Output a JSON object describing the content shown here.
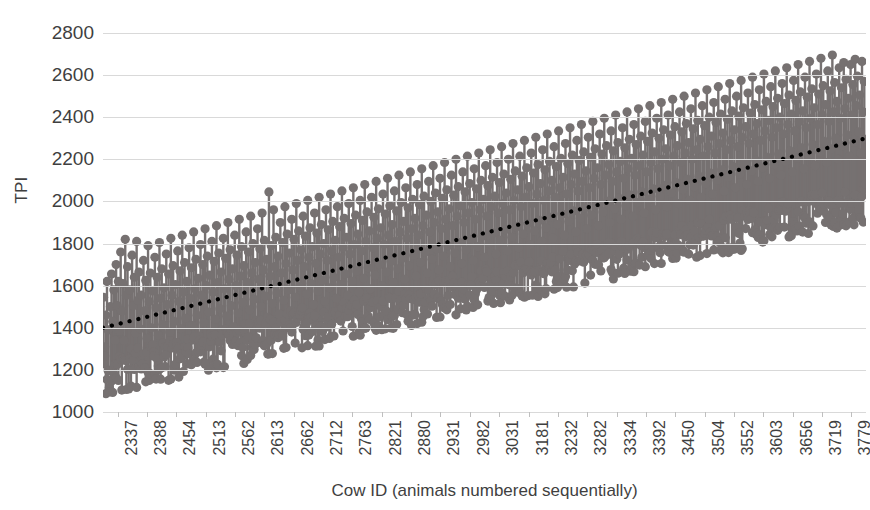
{
  "chart_data": {
    "type": "bar",
    "subtype": "stem-lollipop-with-trendline",
    "title": "",
    "xlabel": "Cow ID (animals numbered sequentially)",
    "ylabel": "TPI",
    "ylim": [
      1000,
      2800
    ],
    "ytick_step": 200,
    "yticks": [
      2800,
      2600,
      2400,
      2200,
      2000,
      1800,
      1600,
      1400,
      1200,
      1000
    ],
    "grid": true,
    "legend": "none",
    "marker_color": "#767171",
    "stem_color": "#767171",
    "trendline_color": "#000000",
    "trendline_style": "dotted",
    "gridline_color": "#d9d9d9",
    "xtick_labels": [
      "2337",
      "2388",
      "2454",
      "2513",
      "2562",
      "2613",
      "2662",
      "2712",
      "2763",
      "2821",
      "2880",
      "2931",
      "2982",
      "3031",
      "3181",
      "3232",
      "3282",
      "3334",
      "3392",
      "3450",
      "3504",
      "3552",
      "3603",
      "3656",
      "3719",
      "3779"
    ],
    "xlim_ids": [
      2337,
      3779
    ],
    "n_xticks": 26,
    "trendline": {
      "x_start_id": 2337,
      "x_end_id": 3779,
      "y_start": 1400,
      "y_end": 2300
    },
    "series": [
      {
        "name": "TPI",
        "note": "One stem per animal; baseline drops from marker; approximately 1450 animals plotted left-to-right by sequential Cow ID.",
        "values": [
          1545,
          1310,
          1460,
          1620,
          1390,
          1115,
          1500,
          1655,
          1430,
          1580,
          1340,
          1700,
          1505,
          1620,
          1385,
          1760,
          1480,
          1610,
          1340,
          1820,
          1555,
          1690,
          1420,
          1580,
          1300,
          1745,
          1505,
          1640,
          1375,
          1810,
          1530,
          1665,
          1395,
          1555,
          1250,
          1720,
          1480,
          1625,
          1350,
          1790,
          1525,
          1660,
          1400,
          1575,
          1285,
          1735,
          1495,
          1640,
          1365,
          1805,
          1540,
          1680,
          1415,
          1590,
          1310,
          1750,
          1510,
          1655,
          1380,
          1825,
          1555,
          1695,
          1430,
          1605,
          1330,
          1765,
          1525,
          1670,
          1395,
          1840,
          1570,
          1710,
          1445,
          1620,
          1345,
          1780,
          1540,
          1685,
          1410,
          1855,
          1585,
          1725,
          1460,
          1635,
          1360,
          1795,
          1555,
          1700,
          1425,
          1870,
          1600,
          1740,
          1475,
          1650,
          1375,
          1810,
          1570,
          1715,
          1440,
          1885,
          1615,
          1755,
          1490,
          1665,
          1390,
          1825,
          1585,
          1730,
          1455,
          1900,
          1630,
          1770,
          1505,
          1680,
          1405,
          1840,
          1600,
          1745,
          1470,
          1915,
          1645,
          1785,
          1520,
          1695,
          1420,
          1855,
          1615,
          1760,
          1485,
          1930,
          1660,
          1800,
          1535,
          1710,
          1435,
          1870,
          1630,
          1775,
          1500,
          1945,
          1675,
          1815,
          1550,
          1725,
          1450,
          2045,
          1645,
          1790,
          1515,
          1960,
          1690,
          1830,
          1565,
          1740,
          1465,
          1900,
          1660,
          1805,
          1530,
          1975,
          1705,
          1845,
          1580,
          1755,
          1480,
          1915,
          1675,
          1820,
          1545,
          1990,
          1720,
          1860,
          1595,
          1770,
          1495,
          1930,
          1690,
          1835,
          1560,
          2005,
          1735,
          1875,
          1610,
          1785,
          1510,
          1945,
          1705,
          1850,
          1575,
          2020,
          1750,
          1890,
          1625,
          1800,
          1525,
          1960,
          1720,
          1865,
          1590,
          2035,
          1765,
          1905,
          1640,
          1815,
          1540,
          1975,
          1735,
          1880,
          1605,
          2050,
          1780,
          1920,
          1655,
          1830,
          1555,
          1990,
          1750,
          1895,
          1620,
          2065,
          1795,
          1935,
          1670,
          1845,
          1570,
          2005,
          1765,
          1910,
          1635,
          2080,
          1810,
          1950,
          1685,
          1860,
          1585,
          2020,
          1780,
          1925,
          1650,
          2095,
          1825,
          1965,
          1700,
          1875,
          1600,
          2035,
          1795,
          1940,
          1665,
          2110,
          1840,
          1980,
          1715,
          1890,
          1615,
          2050,
          1810,
          1955,
          1680,
          2125,
          1855,
          1995,
          1730,
          1905,
          1630,
          2065,
          1825,
          1970,
          1695,
          2140,
          1870,
          2010,
          1745,
          1920,
          1645,
          2080,
          1840,
          1985,
          1710,
          2155,
          1885,
          2025,
          1760,
          1935,
          1660,
          2095,
          1855,
          2000,
          1725,
          2170,
          1900,
          2040,
          1775,
          1950,
          1675,
          2110,
          1870,
          2015,
          1740,
          2185,
          1915,
          2055,
          1790,
          1965,
          1690,
          2125,
          1885,
          2030,
          1755,
          2200,
          1930,
          2070,
          1805,
          1980,
          1705,
          2140,
          1900,
          2045,
          1770,
          2215,
          1945,
          2085,
          1820,
          1995,
          1720,
          2155,
          1915,
          2060,
          1785,
          2230,
          1960,
          2100,
          1835,
          2010,
          1735,
          2170,
          1930,
          2075,
          1800,
          2245,
          1975,
          2115,
          1850,
          2025,
          1750,
          2185,
          1945,
          2090,
          1815,
          2260,
          1990,
          2130,
          1865,
          2040,
          1765,
          2200,
          1960,
          2105,
          1830,
          2275,
          2005,
          2145,
          1880,
          2055,
          1780,
          2215,
          1975,
          2120,
          1845,
          2290,
          2020,
          2160,
          1895,
          2070,
          1795,
          2230,
          1990,
          2135,
          1860,
          2305,
          2035,
          2175,
          1910,
          2085,
          1810,
          2245,
          2005,
          2150,
          1875,
          2320,
          2050,
          2190,
          1925,
          2100,
          1825,
          2260,
          2020,
          2165,
          1890,
          2335,
          2065,
          2205,
          1940,
          2115,
          1840,
          2275,
          2035,
          2180,
          1905,
          2350,
          2080,
          2220,
          1955,
          2130,
          1855,
          2290,
          2050,
          2195,
          1920,
          2365,
          2095,
          2235,
          1970,
          2145,
          1870,
          2305,
          2065,
          2210,
          1935,
          2380,
          2110,
          2250,
          1985,
          2160,
          1885,
          2320,
          2080,
          2225,
          1950,
          2395,
          2125,
          2265,
          2000,
          2175,
          1900,
          2335,
          2095,
          2240,
          1965,
          2410,
          2140,
          2280,
          2015,
          2190,
          1915,
          2350,
          2110,
          2255,
          1980,
          2425,
          2155,
          2295,
          2030,
          2205,
          1930,
          2365,
          2125,
          2270,
          1995,
          2440,
          2170,
          2310,
          2045,
          2220,
          1945,
          2380,
          2140,
          2285,
          2010,
          2455,
          2185,
          2325,
          2060,
          2235,
          1960,
          2395,
          2155,
          2300,
          2025,
          2470,
          2200,
          2340,
          2075,
          2250,
          1975,
          2410,
          2170,
          2315,
          2040,
          2485,
          2215,
          2355,
          2090,
          2265,
          1990,
          2425,
          2185,
          2330,
          2055,
          2500,
          2230,
          2370,
          2105,
          2280,
          2005,
          2440,
          2200,
          2345,
          2070,
          2515,
          2245,
          2385,
          2120,
          2295,
          2020,
          2455,
          2215,
          2360,
          2085,
          2530,
          2260,
          2400,
          2135,
          2310,
          2035,
          2470,
          2230,
          2375,
          2100,
          2545,
          2275,
          2415,
          2150,
          2325,
          2050,
          2485,
          2245,
          2390,
          2115,
          2560,
          2290,
          2430,
          2165,
          2340,
          2065,
          2500,
          2260,
          2405,
          2130,
          2575,
          2305,
          2445,
          2180,
          2355,
          2080,
          2515,
          2275,
          2420,
          2145,
          2590,
          2320,
          2460,
          2195,
          2370,
          2095,
          2530,
          2290,
          2435,
          2160,
          2605,
          2335,
          2475,
          2210,
          2385,
          2110,
          2545,
          2305,
          2450,
          2175,
          2620,
          2350,
          2490,
          2225,
          2400,
          2125,
          2560,
          2320,
          2465,
          2190,
          2635,
          2365,
          2505,
          2240,
          2415,
          2140,
          2575,
          2335,
          2480,
          2205,
          2650,
          2380,
          2520,
          2255,
          2430,
          2155,
          2590,
          2350,
          2495,
          2220,
          2665,
          2395,
          2535,
          2270,
          2445,
          2170,
          2605,
          2365,
          2510,
          2235,
          2680,
          2410,
          2550,
          2285,
          2460,
          2185,
          2620,
          2380,
          2525,
          2250,
          2695,
          2425,
          2565,
          2300,
          2475,
          2200,
          2635,
          2395,
          2540,
          2265,
          2660,
          2440,
          2580,
          2315,
          2490,
          2215,
          2650,
          2410,
          2555,
          2280,
          2675,
          2455,
          2595,
          2330,
          2505,
          2230,
          2665,
          2425,
          2570,
          2295
        ]
      }
    ]
  },
  "axes": {
    "y_title": "TPI",
    "x_title": "Cow ID (animals numbered sequentially)"
  },
  "title_sliver": ""
}
